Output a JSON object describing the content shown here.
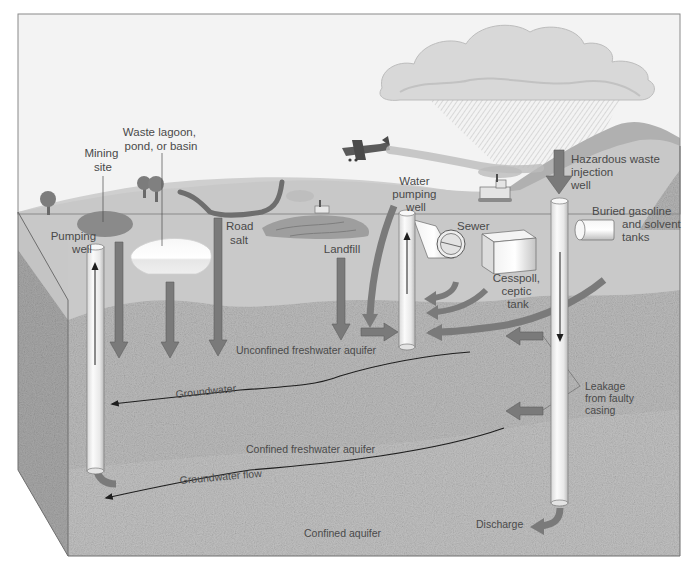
{
  "diagram": {
    "colors": {
      "sky": "#f2f2f2",
      "frame": "#6e6e6e",
      "surface": "#c9c9c9",
      "surface_far": "#d6d6d6",
      "hill": "#b4b4b4",
      "aquifer_unconfined": "#bdbdbd",
      "aquifer_confined": "#c4c4c4",
      "side_face": "#a9a9a9",
      "arrow": "#7a7a7a",
      "arrow_stroke": "#5e5e5e",
      "well_fill": "#f4f4f4",
      "well_shade": "#cfcfcf",
      "flow_line": "#1e1e1e",
      "text": "#4a4a4a",
      "mining_site": "#8a8a8a",
      "cloud": "#dcdcdc"
    },
    "labels": {
      "mining_site": [
        "Mining",
        "site"
      ],
      "waste_lagoon": [
        "Waste lagoon,",
        "pond, or basin"
      ],
      "road_salt": [
        "Road",
        "salt"
      ],
      "pumping_well": [
        "Pumping",
        "well"
      ],
      "landfill": [
        "Landfill"
      ],
      "water_pumping_well": [
        "Water",
        "pumping",
        "well"
      ],
      "sewer": [
        "Sewer"
      ],
      "cesspool": [
        "Cesspoll,",
        "ceptic",
        "tank"
      ],
      "hazardous_waste": [
        "Hazardous waste",
        "injection",
        "well"
      ],
      "buried_tanks": [
        "Buried gasoline",
        "and solvent",
        "tanks"
      ],
      "unconfined_aquifer": "Unconfined freshwater aquifer",
      "groundwater": "Groundwater",
      "leakage": [
        "Leakage",
        "from faulty",
        "casing"
      ],
      "confined_freshwater_aquifer": "Confined freshwater aquifer",
      "groundwater_flow": "Groundwater flow",
      "confined_aquifer": "Confined aquifer",
      "discharge": "Discharge"
    },
    "layers": [
      {
        "name": "Surface soil zone"
      },
      {
        "name": "Unconfined freshwater aquifer"
      },
      {
        "name": "Confined freshwater aquifer"
      },
      {
        "name": "Confined aquifer"
      }
    ],
    "wells": [
      {
        "name": "Pumping well",
        "direction": "up"
      },
      {
        "name": "Water pumping well",
        "direction": "up"
      },
      {
        "name": "Hazardous waste injection well",
        "direction": "down"
      }
    ]
  }
}
